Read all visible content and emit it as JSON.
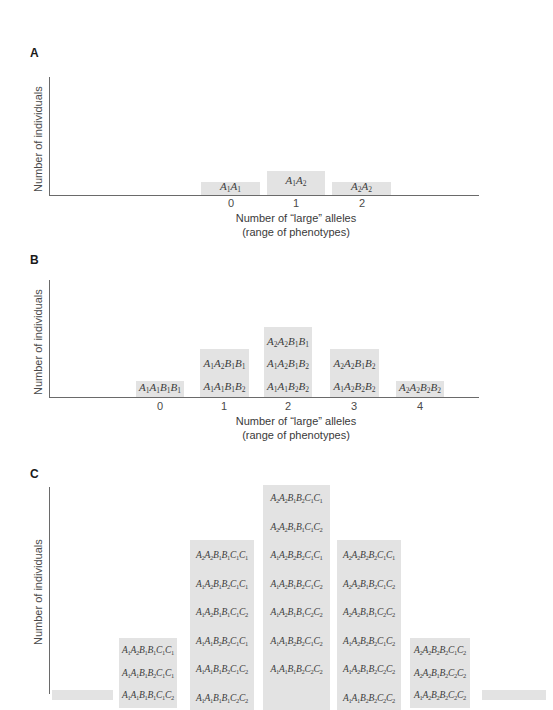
{
  "chart_data": [
    {
      "panel": "A",
      "type": "bar",
      "title": "A",
      "xlabel": "Number of “large” alleles",
      "xlabel_sub": "(range of phenotypes)",
      "ylabel": "Number of individuals",
      "categories": [
        "0",
        "1",
        "2"
      ],
      "values": [
        1,
        2,
        1
      ],
      "genotypes": [
        [
          "A1A1"
        ],
        [
          "A1A2"
        ],
        [
          "A2A2"
        ]
      ],
      "grid": false
    },
    {
      "panel": "B",
      "type": "bar",
      "title": "B",
      "xlabel": "Number of “large” alleles",
      "xlabel_sub": "(range of phenotypes)",
      "ylabel": "Number of individuals",
      "categories": [
        "0",
        "1",
        "2",
        "3",
        "4"
      ],
      "values": [
        1,
        2,
        3,
        2,
        1
      ],
      "genotypes": [
        [
          "A1A1B1B1"
        ],
        [
          "A1A2B1B1",
          "A1A1B1B2"
        ],
        [
          "A2A2B1B1",
          "A1A2B1B2",
          "A1A1B2B2"
        ],
        [
          "A2A2B1B2",
          "A1A2B2B2"
        ],
        [
          "A2A2B2B2"
        ]
      ],
      "grid": false
    },
    {
      "panel": "C",
      "type": "bar",
      "title": "C",
      "ylabel": "Number of individuals",
      "categories": [
        "0",
        "1",
        "2",
        "3",
        "4",
        "5",
        "6"
      ],
      "visible_genotypes": [
        [],
        [
          "A1A2B1B1C1C1",
          "A1A1B1B2C1C1"
        ],
        [
          "A2A2B1B1C1C1",
          "A1A2B1B2C1C1",
          "A1A2B1B1C1C2",
          "A1A1B2B2C1C1",
          "A1A1B1B2C1C2"
        ],
        [
          "A2A2B1B2C1C1",
          "A2A2B1B1C1C2",
          "A1A2B2B2C1C1",
          "A1A2B1B2C1C2",
          "A1A2B1B1C2C2",
          "A1A1B2B2C1C2"
        ],
        [
          "A2A2B2B2C1C1",
          "A2A2B1B2C1C2",
          "A2A2B1B1C2C2",
          "A1A2B2B2C1C2",
          "A1A2B1B2C2C2"
        ],
        [
          "A2A2B2B2C1C2",
          "A2A2B1B2C2C2"
        ],
        []
      ],
      "note": "Panel cropped at bottom; x-axis and lowest genotype rows not visible",
      "grid": false
    }
  ],
  "panels": {
    "a": {
      "letter": "A",
      "ylabel": "Number of individuals",
      "xlabel": "Number of “large” alleles",
      "xlabel_sub": "(range of phenotypes)",
      "ticks": [
        "0",
        "1",
        "2"
      ],
      "bars": [
        {
          "rows": [
            "A1A1"
          ]
        },
        {
          "rows": [
            "A1A2"
          ]
        },
        {
          "rows": [
            "A2A2"
          ]
        }
      ]
    },
    "b": {
      "letter": "B",
      "ylabel": "Number of individuals",
      "xlabel": "Number of “large” alleles",
      "xlabel_sub": "(range of phenotypes)",
      "ticks": [
        "0",
        "1",
        "2",
        "3",
        "4"
      ],
      "bars": [
        {
          "rows": [
            "A1A1B1B1"
          ]
        },
        {
          "rows": [
            "A1A2B1B1",
            "A1A1B1B2"
          ]
        },
        {
          "rows": [
            "A2A2B1B1",
            "A1A2B1B2",
            "A1A1B2B2"
          ]
        },
        {
          "rows": [
            "A2A2B1B2",
            "A1A2B2B2"
          ]
        },
        {
          "rows": [
            "A2A2B2B2"
          ]
        }
      ]
    },
    "c": {
      "letter": "C",
      "ylabel": "Number of individuals",
      "bars": [
        {
          "rows": []
        },
        {
          "rows": [
            "A1A2B1B1C1C1",
            "A1A1B1B2C1C1",
            "A1A1B1B1C1C2"
          ]
        },
        {
          "rows": [
            "A2A2B1B1C1C1",
            "A1A2B1B2C1C1",
            "A1A2B1B1C1C2",
            "A1A1B2B2C1C1",
            "A1A1B1B2C1C2",
            "A1A1B1B1C2C2"
          ]
        },
        {
          "rows": [
            "A2A2B1B2C1C1",
            "A2A2B1B1C1C2",
            "A1A2B2B2C1C1",
            "A1A2B1B2C1C2",
            "A1A2B1B1C2C2",
            "A1A1B2B2C1C2",
            "A1A1B1B2C2C2"
          ]
        },
        {
          "rows": [
            "A2A2B2B2C1C1",
            "A2A2B1B2C1C2",
            "A2A2B1B1C2C2",
            "A1A2B2B2C1C2",
            "A1A2B1B2C2C2",
            "A1A1B2B2C2C2"
          ]
        },
        {
          "rows": [
            "A2A2B2B2C1C2",
            "A2A2B1B2C2C2",
            "A1A2B2B2C2C2"
          ]
        },
        {
          "rows": []
        }
      ]
    }
  },
  "colors": {
    "bar_fill": "#e3e3e3",
    "axis": "#6a6a6a",
    "text": "#3a3a3a"
  }
}
